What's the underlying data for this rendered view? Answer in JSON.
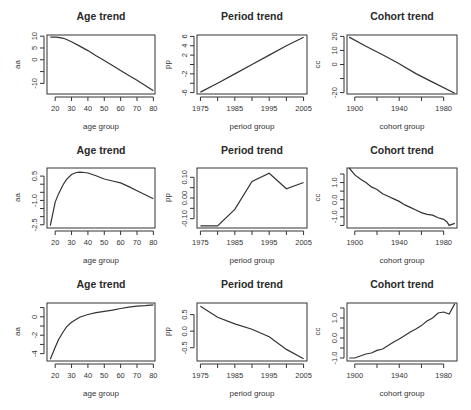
{
  "chart_data": [
    {
      "type": "line",
      "row": 1,
      "col": 1,
      "title": "Age trend",
      "xlabel": "age group",
      "ylabel": "aa",
      "xlim": [
        15,
        81
      ],
      "ylim": [
        -14.5,
        10.5
      ],
      "xticks": [
        20,
        30,
        40,
        50,
        60,
        70,
        80
      ],
      "xtick_labels": [
        "20",
        "30",
        "40",
        "50",
        "60",
        "70",
        "80"
      ],
      "yticks": [
        -10,
        -5,
        0,
        5,
        10
      ],
      "ytick_labels": [
        "-10",
        "",
        "0",
        "5",
        "10"
      ],
      "x": [
        17,
        20,
        22,
        25,
        27,
        30,
        35,
        40,
        45,
        50,
        55,
        60,
        65,
        70,
        75,
        80
      ],
      "y": [
        9.6,
        9.6,
        9.5,
        9.1,
        8.6,
        7.6,
        5.8,
        3.9,
        1.7,
        -0.3,
        -2.4,
        -4.5,
        -6.6,
        -8.7,
        -10.9,
        -13.1
      ]
    },
    {
      "type": "line",
      "row": 1,
      "col": 2,
      "title": "Period trend",
      "xlabel": "period group",
      "ylabel": "pp",
      "xlim": [
        1974,
        2006
      ],
      "ylim": [
        -6.3,
        6.3
      ],
      "xticks": [
        1975,
        1980,
        1985,
        1990,
        1995,
        2000,
        2005
      ],
      "xtick_labels": [
        "1975",
        "",
        "1985",
        "",
        "1995",
        "",
        "2005"
      ],
      "yticks": [
        -6,
        -4,
        -2,
        0,
        2,
        4,
        6
      ],
      "ytick_labels": [
        "-6",
        "",
        "-2",
        "",
        "2",
        "4",
        "6"
      ],
      "x": [
        1975,
        1980,
        1985,
        1990,
        1995,
        2000,
        2005
      ],
      "y": [
        -5.9,
        -4.0,
        -2.0,
        0.0,
        2.0,
        4.0,
        5.8
      ]
    },
    {
      "type": "line",
      "row": 1,
      "col": 3,
      "title": "Cohort trend",
      "xlabel": "cohort group",
      "ylabel": "cc",
      "xlim": [
        1893,
        1992
      ],
      "ylim": [
        -21,
        21
      ],
      "xticks": [
        1900,
        1920,
        1940,
        1960,
        1980
      ],
      "xtick_labels": [
        "1900",
        "",
        "1940",
        "",
        "1980"
      ],
      "yticks": [
        -20,
        -10,
        0,
        10,
        20
      ],
      "ytick_labels": [
        "-20",
        "",
        "0",
        "10",
        "20"
      ],
      "x": [
        1895,
        1910,
        1925,
        1940,
        1955,
        1970,
        1990
      ],
      "y": [
        19.5,
        13.0,
        7.0,
        0.5,
        -6.5,
        -12.5,
        -20.5
      ]
    },
    {
      "type": "line",
      "row": 2,
      "col": 1,
      "title": "Age trend",
      "xlabel": "age group",
      "ylabel": "aa",
      "xlim": [
        15,
        81
      ],
      "ylim": [
        -2.7,
        1.0
      ],
      "xticks": [
        20,
        30,
        40,
        50,
        60,
        70,
        80
      ],
      "xtick_labels": [
        "20",
        "30",
        "40",
        "50",
        "60",
        "70",
        "80"
      ],
      "yticks": [
        -2.5,
        -2.0,
        -1.5,
        -1.0,
        -0.5,
        0.0,
        0.5
      ],
      "ytick_labels": [
        "-2.5",
        "",
        "",
        "-1.0",
        "",
        "",
        "0.5"
      ],
      "x": [
        17,
        20,
        22,
        25,
        27,
        30,
        33,
        35,
        38,
        40,
        45,
        50,
        55,
        60,
        65,
        70,
        75,
        80
      ],
      "y": [
        -2.55,
        -1.1,
        -0.6,
        0.0,
        0.3,
        0.6,
        0.72,
        0.74,
        0.72,
        0.69,
        0.52,
        0.32,
        0.2,
        0.08,
        -0.15,
        -0.4,
        -0.65,
        -0.9
      ]
    },
    {
      "type": "line",
      "row": 2,
      "col": 2,
      "title": "Period trend",
      "xlabel": "period group",
      "ylabel": "pp",
      "xlim": [
        1974,
        2006
      ],
      "ylim": [
        -0.145,
        0.145
      ],
      "xticks": [
        1975,
        1980,
        1985,
        1990,
        1995,
        2000,
        2005
      ],
      "xtick_labels": [
        "1975",
        "",
        "1985",
        "",
        "1995",
        "",
        "2005"
      ],
      "yticks": [
        -0.1,
        -0.05,
        0.0,
        0.05,
        0.1
      ],
      "ytick_labels": [
        "-0.10",
        "",
        "0.00",
        "",
        "0.10"
      ],
      "x": [
        1975,
        1980,
        1985,
        1990,
        1995,
        2000,
        2005
      ],
      "y": [
        -0.135,
        -0.135,
        -0.055,
        0.08,
        0.12,
        0.045,
        0.075
      ]
    },
    {
      "type": "line",
      "row": 2,
      "col": 3,
      "title": "Cohort trend",
      "xlabel": "cohort group",
      "ylabel": "cc",
      "xlim": [
        1893,
        1992
      ],
      "ylim": [
        -1.65,
        1.85
      ],
      "xticks": [
        1900,
        1920,
        1940,
        1960,
        1980
      ],
      "xtick_labels": [
        "1900",
        "",
        "1940",
        "",
        "1980"
      ],
      "yticks": [
        -1.5,
        -1.0,
        -0.5,
        0.0,
        0.5,
        1.0,
        1.5
      ],
      "ytick_labels": [
        "",
        "-1.0",
        "",
        "0.0",
        "",
        "1.0",
        ""
      ],
      "x": [
        1895,
        1900,
        1905,
        1910,
        1915,
        1920,
        1925,
        1930,
        1935,
        1940,
        1945,
        1950,
        1955,
        1960,
        1965,
        1970,
        1975,
        1980,
        1983,
        1985,
        1988,
        1990
      ],
      "y": [
        1.85,
        1.45,
        1.2,
        1.0,
        0.75,
        0.6,
        0.35,
        0.2,
        0.05,
        -0.1,
        -0.3,
        -0.45,
        -0.6,
        -0.75,
        -0.85,
        -0.9,
        -1.05,
        -1.15,
        -1.3,
        -1.5,
        -1.42,
        -1.38
      ]
    },
    {
      "type": "line",
      "row": 3,
      "col": 1,
      "title": "Age trend",
      "xlabel": "age group",
      "ylabel": "aa",
      "xlim": [
        15,
        81
      ],
      "ylim": [
        -4.8,
        1.5
      ],
      "xticks": [
        20,
        30,
        40,
        50,
        60,
        70,
        80
      ],
      "xtick_labels": [
        "20",
        "30",
        "40",
        "50",
        "60",
        "70",
        "80"
      ],
      "yticks": [
        -4,
        -3,
        -2,
        -1,
        0,
        1
      ],
      "ytick_labels": [
        "-4",
        "",
        "-2",
        "",
        "0",
        ""
      ],
      "x": [
        17,
        20,
        22,
        25,
        27,
        30,
        35,
        40,
        45,
        50,
        55,
        60,
        65,
        70,
        75,
        80
      ],
      "y": [
        -4.6,
        -3.3,
        -2.5,
        -1.6,
        -1.1,
        -0.6,
        -0.05,
        0.25,
        0.45,
        0.6,
        0.72,
        0.9,
        1.05,
        1.15,
        1.22,
        1.3
      ]
    },
    {
      "type": "line",
      "row": 3,
      "col": 2,
      "title": "Period trend",
      "xlabel": "period group",
      "ylabel": "pp",
      "xlim": [
        1974,
        2006
      ],
      "ylim": [
        -0.9,
        0.85
      ],
      "xticks": [
        1975,
        1980,
        1985,
        1990,
        1995,
        2000,
        2005
      ],
      "xtick_labels": [
        "1975",
        "",
        "1985",
        "",
        "1995",
        "",
        "2005"
      ],
      "yticks": [
        -0.5,
        0.0,
        0.5
      ],
      "ytick_labels": [
        "-0.5",
        "0.0",
        "0.5"
      ],
      "x": [
        1975,
        1980,
        1985,
        1990,
        1995,
        2000,
        2005
      ],
      "y": [
        0.75,
        0.42,
        0.22,
        0.06,
        -0.17,
        -0.55,
        -0.83
      ]
    },
    {
      "type": "line",
      "row": 3,
      "col": 3,
      "title": "Cohort trend",
      "xlabel": "cohort group",
      "ylabel": "cc",
      "xlim": [
        1893,
        1992
      ],
      "ylim": [
        -1.15,
        1.75
      ],
      "xticks": [
        1900,
        1920,
        1940,
        1960,
        1980
      ],
      "xtick_labels": [
        "1900",
        "",
        "1940",
        "",
        "1980"
      ],
      "yticks": [
        -1.0,
        -0.5,
        0.0,
        0.5,
        1.0,
        1.5
      ],
      "ytick_labels": [
        "-1.0",
        "",
        "0.0",
        "",
        "1.0",
        ""
      ],
      "x": [
        1895,
        1900,
        1905,
        1910,
        1915,
        1920,
        1925,
        1930,
        1935,
        1940,
        1945,
        1950,
        1955,
        1960,
        1965,
        1970,
        1975,
        1980,
        1985,
        1990
      ],
      "y": [
        -1.0,
        -1.0,
        -0.9,
        -0.8,
        -0.75,
        -0.62,
        -0.55,
        -0.38,
        -0.2,
        -0.05,
        0.12,
        0.3,
        0.45,
        0.62,
        0.85,
        1.0,
        1.25,
        1.3,
        1.2,
        1.72
      ]
    }
  ]
}
